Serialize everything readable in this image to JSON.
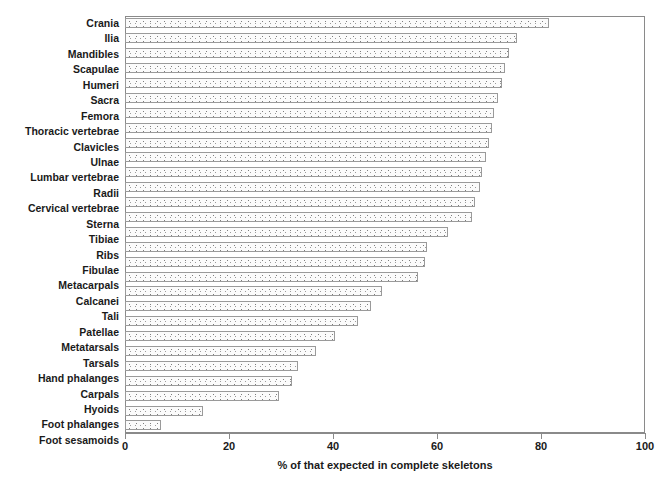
{
  "chart_data": {
    "type": "bar",
    "orientation": "horizontal",
    "title": "",
    "xlabel": "% of that expected in complete skeletons",
    "ylabel": "",
    "xlim": [
      0,
      100
    ],
    "xticks": [
      0,
      20,
      40,
      60,
      80,
      100
    ],
    "grid": false,
    "legend": null,
    "categories": [
      "Crania",
      "Ilia",
      "Mandibles",
      "Scapulae",
      "Humeri",
      "Sacra",
      "Femora",
      "Thoracic vertebrae",
      "Clavicles",
      "Ulnae",
      "Lumbar vertebrae",
      "Radii",
      "Cervical vertebrae",
      "Sterna",
      "Tibiae",
      "Ribs",
      "Fibulae",
      "Metacarpals",
      "Calcanei",
      "Tali",
      "Patellae",
      "Metatarsals",
      "Tarsals",
      "Hand phalanges",
      "Carpals",
      "Hyoids",
      "Foot phalanges",
      "Foot sesamoids"
    ],
    "values": [
      81.5,
      75.4,
      73.8,
      73.0,
      72.5,
      71.8,
      71.0,
      70.5,
      70.0,
      69.5,
      68.6,
      68.3,
      67.3,
      66.7,
      62.1,
      58.1,
      57.7,
      56.4,
      49.4,
      47.3,
      44.8,
      40.4,
      36.7,
      33.3,
      32.1,
      29.6,
      15.0,
      6.9
    ],
    "bar_fill": "#fbfbfb",
    "bar_border": "#9a9a9a",
    "axis_color": "#8a8a8a",
    "text_color": "#1a1a1a"
  }
}
